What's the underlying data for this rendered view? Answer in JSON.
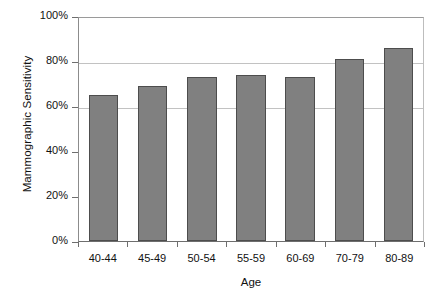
{
  "chart_data": {
    "type": "bar",
    "title": "",
    "xlabel": "Age",
    "ylabel": "Mammographic Sensitivity",
    "categories": [
      "40-44",
      "45-49",
      "50-54",
      "55-59",
      "60-69",
      "70-79",
      "80-89"
    ],
    "values": [
      65,
      69,
      73,
      74,
      73,
      81,
      86
    ],
    "ylim": [
      0,
      100
    ],
    "ytick_labels": [
      "100%",
      "80%",
      "60%",
      "40%",
      "20%",
      "0%"
    ],
    "ytick_values": [
      100,
      80,
      60,
      40,
      20,
      0
    ],
    "gridlines_at": [
      80,
      60
    ],
    "grid": true,
    "legend": "none",
    "bar_color": "#808080",
    "bar_border_color": "#4d4d4d",
    "gridline_color": "#c2c2c2",
    "axis_color": "#6e6e6e",
    "background": "#ffffff",
    "value_suffix": "%"
  }
}
